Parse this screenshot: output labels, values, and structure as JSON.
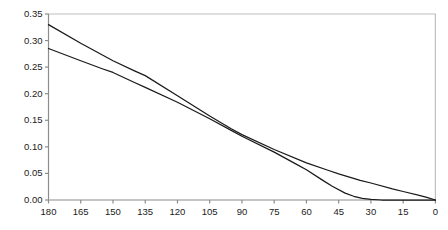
{
  "chart_data": {
    "type": "line",
    "title": "",
    "xlabel": "",
    "ylabel": "",
    "xlim": [
      180,
      0
    ],
    "ylim": [
      0.0,
      0.35
    ],
    "x_reversed": true,
    "grid": false,
    "legend": null,
    "xticks": [
      180,
      165,
      150,
      135,
      120,
      105,
      90,
      75,
      60,
      45,
      30,
      15,
      0
    ],
    "xticklabels": [
      "180",
      "165",
      "150",
      "135",
      "120",
      "105",
      "90",
      "75",
      "60",
      "45",
      "30",
      "15",
      "0"
    ],
    "yticks": [
      0.0,
      0.05,
      0.1,
      0.15,
      0.2,
      0.25,
      0.3,
      0.35
    ],
    "yticklabels": [
      "0.00",
      "0.05",
      "0.10",
      "0.15",
      "0.20",
      "0.25",
      "0.30",
      "0.35"
    ],
    "line_color": "#1a1a1a",
    "frame_color": "#bcbcbc",
    "series": [
      {
        "name": "curve-upper",
        "x": [
          180,
          165,
          150,
          140,
          135,
          120,
          105,
          95,
          90,
          75,
          60,
          50,
          45,
          35,
          30,
          20,
          15,
          8,
          4,
          0
        ],
        "y": [
          0.33,
          0.295,
          0.262,
          0.243,
          0.234,
          0.196,
          0.158,
          0.134,
          0.123,
          0.095,
          0.07,
          0.056,
          0.049,
          0.037,
          0.032,
          0.021,
          0.016,
          0.009,
          0.005,
          0.0
        ]
      },
      {
        "name": "curve-lower",
        "x": [
          180,
          165,
          155,
          150,
          140,
          135,
          120,
          105,
          95,
          90,
          75,
          65,
          60,
          52,
          48,
          42,
          38,
          34,
          30,
          25,
          15,
          0
        ],
        "y": [
          0.285,
          0.262,
          0.247,
          0.24,
          0.221,
          0.212,
          0.184,
          0.153,
          0.131,
          0.12,
          0.09,
          0.068,
          0.057,
          0.036,
          0.026,
          0.013,
          0.007,
          0.003,
          0.001,
          0.0,
          0.0,
          0.0
        ]
      }
    ]
  }
}
